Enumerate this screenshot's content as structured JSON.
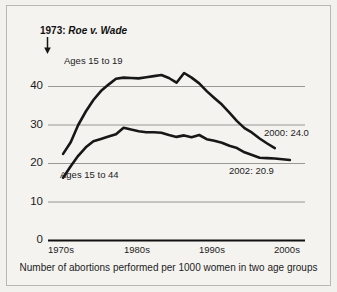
{
  "chart_data": {
    "type": "line",
    "title": "",
    "caption": "Number of abortions performed per 1000 women in two age groups",
    "xlabel": "",
    "ylabel": "",
    "ylim": [
      0,
      45
    ],
    "yticks": [
      0,
      10,
      20,
      30,
      40
    ],
    "ytick_labels": [
      "0",
      "10",
      "20",
      "30",
      "40"
    ],
    "xlim": [
      1970,
      2004
    ],
    "xticks": [
      1970,
      1980,
      1990,
      2000
    ],
    "xtick_labels": [
      "1970s",
      "1980s",
      "1990s",
      "2000s"
    ],
    "grid": "horizontal",
    "legend": "inline-labels",
    "annotations": [
      {
        "name": "roe-v-wade",
        "year_text": "1973:",
        "case_text": "Roe v. Wade",
        "full_text": "1973: Roe v. Wade",
        "x": 1973,
        "marker": "down-arrow"
      },
      {
        "name": "upper-end-value",
        "text": "2000: 24.0",
        "x": 2000,
        "value": 24.0
      },
      {
        "name": "lower-end-value",
        "text": "2002: 20.9",
        "x": 2002,
        "value": 20.9
      }
    ],
    "series": [
      {
        "name": "Ages 15 to 19",
        "label": "Ages 15 to 19",
        "color": "#171717",
        "x": [
          1972,
          1973,
          1974,
          1975,
          1976,
          1977,
          1978,
          1979,
          1980,
          1981,
          1982,
          1983,
          1984,
          1985,
          1986,
          1987,
          1988,
          1989,
          1990,
          1991,
          1992,
          1993,
          1994,
          1995,
          1996,
          1997,
          1998,
          1999,
          2000
        ],
        "values": [
          22.5,
          25.5,
          30.0,
          33.5,
          36.5,
          38.8,
          40.5,
          42.0,
          42.3,
          42.2,
          42.1,
          42.4,
          42.7,
          43.0,
          42.2,
          41.0,
          43.5,
          42.3,
          40.8,
          38.8,
          37.0,
          35.3,
          33.2,
          31.0,
          29.2,
          28.0,
          26.5,
          25.2,
          24.0
        ]
      },
      {
        "name": "Ages 15 to 44",
        "label": "Ages 15 to 44",
        "color": "#171717",
        "x": [
          1972,
          1973,
          1974,
          1975,
          1976,
          1977,
          1978,
          1979,
          1980,
          1981,
          1982,
          1983,
          1984,
          1985,
          1986,
          1987,
          1988,
          1989,
          1990,
          1991,
          1992,
          1993,
          1994,
          1995,
          1996,
          1997,
          1998,
          1999,
          2000,
          2001,
          2002
        ],
        "values": [
          16.3,
          19.3,
          22.0,
          24.2,
          25.8,
          26.4,
          27.0,
          27.6,
          29.3,
          28.8,
          28.4,
          28.1,
          28.1,
          28.0,
          27.4,
          26.9,
          27.3,
          26.8,
          27.4,
          26.3,
          25.9,
          25.4,
          24.6,
          24.0,
          22.9,
          22.2,
          21.5,
          21.4,
          21.3,
          21.1,
          20.9
        ]
      }
    ]
  },
  "colors": {
    "background": "#f2f1ee",
    "panel": "#f4f3f0",
    "border": "#b9b7b2",
    "line": "#171717",
    "grid": "#8f8d89",
    "axis": "#111111",
    "text": "#1c1c1c"
  }
}
